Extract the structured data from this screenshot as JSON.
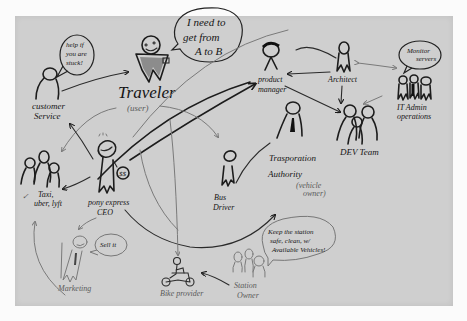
{
  "diagram": {
    "medium": "hand-drawn sketch on grey paper",
    "actors": [
      {
        "id": "traveler",
        "label": "Traveler",
        "sublabel": "(user)",
        "speech": [
          "I need to",
          "get from",
          "A to B"
        ]
      },
      {
        "id": "customer-service",
        "label": [
          "customer",
          "Service"
        ],
        "speech": [
          "help if",
          "you are",
          "stuck!"
        ]
      },
      {
        "id": "product-manager",
        "label": [
          "product",
          "manager"
        ]
      },
      {
        "id": "architect",
        "label": "Architect"
      },
      {
        "id": "it-admin",
        "label": [
          "IT Admin",
          "operations"
        ],
        "speech": [
          "Monitor",
          "servers"
        ]
      },
      {
        "id": "dev-team",
        "label": "DEV Team"
      },
      {
        "id": "ceo",
        "label": [
          "pony express",
          "CEO"
        ]
      },
      {
        "id": "taxi",
        "label": [
          "Taxi,",
          "uber, lyft"
        ]
      },
      {
        "id": "bus-driver",
        "label": [
          "Bus",
          "Driver"
        ]
      },
      {
        "id": "transport-authority",
        "label": [
          "Trasporation",
          "Authority"
        ],
        "sublabel": [
          "(vehicle",
          "owner)"
        ]
      },
      {
        "id": "marketing",
        "label": "Marketing",
        "speech": [
          "Sell it"
        ]
      },
      {
        "id": "bike-provider",
        "label": "Bike provider"
      },
      {
        "id": "station-owner",
        "label": [
          "Station",
          "Owner"
        ],
        "speech": [
          "Keep the station",
          "safe, clean, w/",
          "Available Vehicles!"
        ]
      }
    ],
    "relations": [
      {
        "from": "customer-service",
        "to": "traveler"
      },
      {
        "from": "ceo",
        "to": "customer-service"
      },
      {
        "from": "ceo",
        "to": "taxi"
      },
      {
        "from": "ceo",
        "to": "product-manager"
      },
      {
        "from": "ceo",
        "to": "bus-driver"
      },
      {
        "from": "ceo",
        "to": "transport-authority"
      },
      {
        "from": "ceo",
        "to": "marketing"
      },
      {
        "from": "traveler",
        "to": "bus-driver"
      },
      {
        "from": "traveler",
        "to": "customer-service"
      },
      {
        "from": "product-manager",
        "to": "dev-team"
      },
      {
        "from": "architect",
        "to": "product-manager"
      },
      {
        "from": "architect",
        "to": "dev-team"
      },
      {
        "from": "architect",
        "to": "it-admin"
      },
      {
        "from": "it-admin",
        "to": "dev-team"
      },
      {
        "from": "transport-authority",
        "to": "bus-driver"
      },
      {
        "from": "station-owner",
        "to": "bike-provider"
      },
      {
        "from": "marketing",
        "to": "taxi"
      }
    ],
    "colors": {
      "paper": "#cfcfcf",
      "background": "#fbfbfb",
      "ink": "#1c1c1c",
      "pencil": "#7a7a7a"
    }
  }
}
